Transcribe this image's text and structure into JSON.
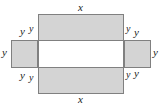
{
  "figure": {
    "colors": {
      "fill": "#d4d4d4",
      "stroke": "#808080",
      "hollow_fill": "#ffffff",
      "text": "#1a1a1a",
      "background": "#ffffff"
    },
    "shapes": [
      {
        "id": "top-flap",
        "name": "top-rectangle",
        "x": 38,
        "y": 14,
        "w": 86,
        "h": 27,
        "fill": "gray"
      },
      {
        "id": "bottom-flap",
        "name": "bottom-rectangle",
        "x": 38,
        "y": 67,
        "w": 86,
        "h": 27,
        "fill": "gray"
      },
      {
        "id": "left-flap",
        "name": "left-rectangle",
        "x": 11,
        "y": 40,
        "w": 27,
        "h": 28,
        "fill": "gray"
      },
      {
        "id": "right-flap",
        "name": "right-rectangle",
        "x": 124,
        "y": 40,
        "w": 27,
        "h": 28,
        "fill": "gray"
      },
      {
        "id": "center-face",
        "name": "center-rectangle",
        "x": 38,
        "y": 40,
        "w": 86,
        "h": 28,
        "fill": "white"
      }
    ],
    "labels": [
      {
        "id": "x-top",
        "text": "x",
        "x": 78,
        "y": 2,
        "size": "normal"
      },
      {
        "id": "x-bottom",
        "text": "x",
        "x": 78,
        "y": 94,
        "size": "normal"
      },
      {
        "id": "y-left-outer",
        "text": "y",
        "x": 2,
        "y": 47,
        "size": "normal"
      },
      {
        "id": "y-right-outer",
        "text": "y",
        "x": 153,
        "y": 47,
        "size": "normal"
      },
      {
        "id": "y-tl-a",
        "text": "y",
        "x": 20,
        "y": 26,
        "size": "normal"
      },
      {
        "id": "y-tl-b",
        "text": "y",
        "x": 29,
        "y": 24,
        "size": "small"
      },
      {
        "id": "y-tr-a",
        "text": "y",
        "x": 126,
        "y": 24,
        "size": "small"
      },
      {
        "id": "y-tr-b",
        "text": "y",
        "x": 134,
        "y": 27,
        "size": "normal"
      },
      {
        "id": "y-bl-a",
        "text": "y",
        "x": 20,
        "y": 70,
        "size": "normal"
      },
      {
        "id": "y-bl-b",
        "text": "y",
        "x": 29,
        "y": 73,
        "size": "small"
      },
      {
        "id": "y-br-a",
        "text": "y",
        "x": 126,
        "y": 70,
        "size": "small"
      },
      {
        "id": "y-br-b",
        "text": "y",
        "x": 134,
        "y": 68,
        "size": "normal"
      }
    ]
  }
}
